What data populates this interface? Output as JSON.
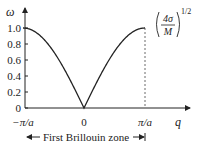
{
  "chart_data": {
    "type": "line",
    "title": "",
    "xlabel": "q",
    "ylabel": "ω",
    "xlim": [
      -1,
      1.3
    ],
    "ylim": [
      0,
      1.1
    ],
    "x_unit": "π/a",
    "yticks": [
      0,
      0.2,
      0.4,
      0.6,
      0.8,
      1.0
    ],
    "ytick_labels": [
      "0",
      "0.2",
      "0.4",
      "0.6",
      "0.8",
      "1.0"
    ],
    "xticks": [
      -1,
      0,
      1
    ],
    "xtick_labels": [
      "−π/a",
      "0",
      "π/a"
    ],
    "series": [
      {
        "name": "dispersion",
        "function": "|sin(q·a/2)|",
        "x": [
          -1,
          -0.75,
          -0.5,
          -0.25,
          0,
          0.25,
          0.5,
          0.75,
          1
        ],
        "values": [
          1.0,
          0.924,
          0.707,
          0.383,
          0.0,
          0.383,
          0.707,
          0.924,
          1.0
        ]
      }
    ],
    "annotations": {
      "max_label": {
        "numerator": "4σ",
        "denominator": "M",
        "exponent": "1/2"
      },
      "zone_label": "First Brillouin zone",
      "dashed_line_at": 1
    },
    "grid": false,
    "legend": "none"
  }
}
